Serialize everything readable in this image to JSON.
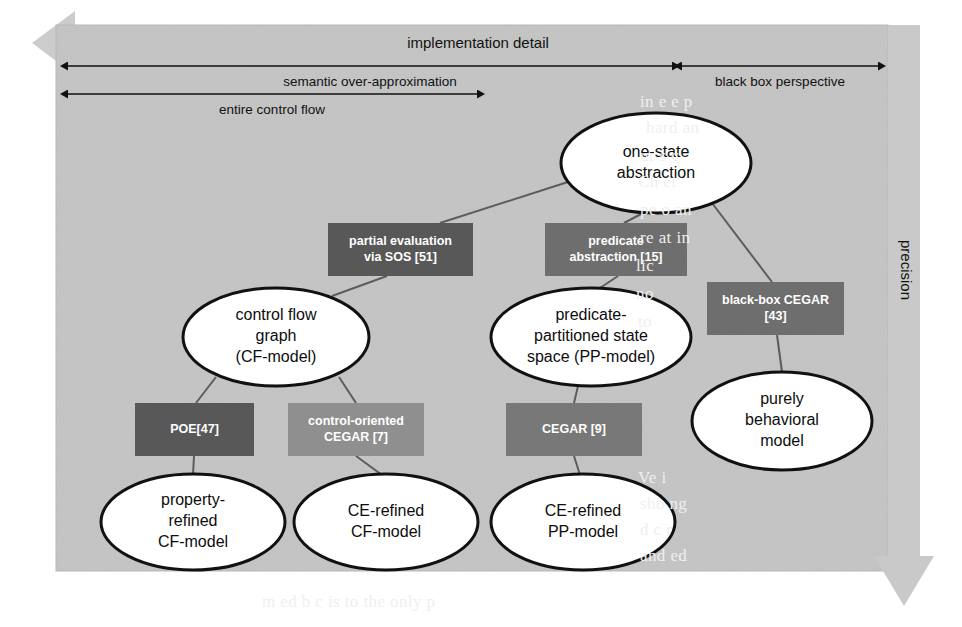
{
  "figure": {
    "panel_color": "#bfbfbf",
    "panel_color_light": "#cfcfcf",
    "arrow_gray": "#c9c9c9",
    "line_color": "#5c5c5c",
    "ellipse_fill": "#ffffff",
    "ellipse_stroke": "#111111"
  },
  "axes": {
    "vertical": {
      "label": "precision",
      "direction": "down"
    },
    "horizontal": [
      {
        "id": "implementation-detail",
        "label": "implementation detail",
        "direction": "left",
        "style": "block-arrow"
      },
      {
        "id": "semantic-over-approximation",
        "label": "semantic over-approximation",
        "direction": "both"
      },
      {
        "id": "black-box-perspective",
        "label": "black box perspective",
        "direction": "both"
      },
      {
        "id": "entire-control-flow",
        "label": "entire control flow",
        "direction": "both"
      }
    ]
  },
  "nodes": {
    "ellipses": [
      {
        "id": "one-state-abstraction",
        "lines": [
          "one-state",
          "abstraction"
        ],
        "cx": 656,
        "cy": 163,
        "rx": 95,
        "ry": 50
      },
      {
        "id": "control-flow-graph",
        "lines": [
          "control flow",
          "graph",
          "(CF-model)"
        ],
        "cx": 276,
        "cy": 337,
        "rx": 93,
        "ry": 49
      },
      {
        "id": "predicate-partitioned-state-space",
        "lines": [
          "predicate-",
          "partitioned state",
          "space (PP-model)"
        ],
        "cx": 591,
        "cy": 337,
        "rx": 100,
        "ry": 49
      },
      {
        "id": "purely-behavioral-model",
        "lines": [
          "purely",
          "behavioral",
          "model"
        ],
        "cx": 782,
        "cy": 421,
        "rx": 90,
        "ry": 49
      },
      {
        "id": "property-refined-cf-model",
        "lines": [
          "property-",
          "refined",
          "CF-model"
        ],
        "cx": 193,
        "cy": 522,
        "rx": 92,
        "ry": 48
      },
      {
        "id": "ce-refined-cf-model",
        "lines": [
          "CE-refined",
          "CF-model"
        ],
        "cx": 386,
        "cy": 522,
        "rx": 92,
        "ry": 48
      },
      {
        "id": "ce-refined-pp-model",
        "lines": [
          "CE-refined",
          "PP-model"
        ],
        "cx": 583,
        "cy": 522,
        "rx": 92,
        "ry": 48
      }
    ],
    "boxes": [
      {
        "id": "partial-evaluation-via-sos",
        "lines": [
          "partial evaluation",
          "via SOS [51]"
        ],
        "x": 328,
        "y": 223,
        "w": 145,
        "h": 53,
        "fill": "#585858"
      },
      {
        "id": "predicate-abstraction",
        "lines": [
          "predicate",
          "abstraction [15]"
        ],
        "x": 545,
        "y": 223,
        "w": 142,
        "h": 53,
        "fill": "#6e6e6e"
      },
      {
        "id": "black-box-cegar",
        "lines": [
          "black-box CEGAR",
          "[43]"
        ],
        "x": 707,
        "y": 282,
        "w": 137,
        "h": 53,
        "fill": "#6e6e6e"
      },
      {
        "id": "poe",
        "lines": [
          "POE[47]"
        ],
        "x": 135,
        "y": 403,
        "w": 119,
        "h": 53,
        "fill": "#585858"
      },
      {
        "id": "control-oriented-cegar",
        "lines": [
          "control-oriented",
          "CEGAR [7]"
        ],
        "x": 288,
        "y": 403,
        "w": 136,
        "h": 53,
        "fill": "#8f8f8f"
      },
      {
        "id": "cegar",
        "lines": [
          "CEGAR [9]"
        ],
        "x": 506,
        "y": 403,
        "w": 136,
        "h": 53,
        "fill": "#787878"
      }
    ],
    "edges": [
      {
        "id": "edge-onestate-to-partialeval",
        "from": "one-state-abstraction",
        "to": "partial-evaluation-via-sos",
        "x1": 571,
        "y1": 181,
        "x2": 440,
        "y2": 223
      },
      {
        "id": "edge-onestate-to-predabs",
        "from": "one-state-abstraction",
        "to": "predicate-abstraction",
        "x1": 643,
        "y1": 213,
        "x2": 624,
        "y2": 223
      },
      {
        "id": "edge-onestate-to-blackboxcegar",
        "from": "one-state-abstraction",
        "to": "black-box-cegar",
        "x1": 712,
        "y1": 203,
        "x2": 772,
        "y2": 282
      },
      {
        "id": "edge-partialeval-to-cfg",
        "from": "partial-evaluation-via-sos",
        "to": "control-flow-graph",
        "x1": 387,
        "y1": 276,
        "x2": 332,
        "y2": 296
      },
      {
        "id": "edge-predabs-to-pp",
        "from": "predicate-abstraction",
        "to": "predicate-partitioned-state-space",
        "x1": 618,
        "y1": 276,
        "x2": 600,
        "y2": 288
      },
      {
        "id": "edge-blackboxcegar-to-purely",
        "from": "black-box-cegar",
        "to": "purely-behavioral-model",
        "x1": 777,
        "y1": 335,
        "x2": 782,
        "y2": 372
      },
      {
        "id": "edge-cfg-to-poe",
        "from": "control-flow-graph",
        "to": "poe",
        "x1": 216,
        "y1": 377,
        "x2": 196,
        "y2": 403
      },
      {
        "id": "edge-cfg-to-coCegar",
        "from": "control-flow-graph",
        "to": "control-oriented-cegar",
        "x1": 339,
        "y1": 377,
        "x2": 356,
        "y2": 403
      },
      {
        "id": "edge-pp-to-cegar",
        "from": "predicate-partitioned-state-space",
        "to": "cegar",
        "x1": 578,
        "y1": 386,
        "x2": 574,
        "y2": 403
      },
      {
        "id": "edge-poe-to-propertyrefined",
        "from": "poe",
        "to": "property-refined-cf-model",
        "x1": 194,
        "y1": 456,
        "x2": 193,
        "y2": 475
      },
      {
        "id": "edge-coCegar-to-cerefinedcf",
        "from": "control-oriented-cegar",
        "to": "ce-refined-cf-model",
        "x1": 356,
        "y1": 456,
        "x2": 382,
        "y2": 475
      },
      {
        "id": "edge-cegar-to-cerefinedpp",
        "from": "cegar",
        "to": "ce-refined-pp-model",
        "x1": 574,
        "y1": 456,
        "x2": 580,
        "y2": 475
      }
    ]
  },
  "background_bleed": [
    {
      "text": "in   e   e    p",
      "x": 640,
      "y": 92
    },
    {
      "text": "hard     an",
      "x": 646,
      "y": 118
    },
    {
      "text": "ur    s     c",
      "x": 640,
      "y": 146
    },
    {
      "text": "Ch       ei",
      "x": 638,
      "y": 172
    },
    {
      "text": "pe   o    an",
      "x": 640,
      "y": 200
    },
    {
      "text": "re   at    in",
      "x": 640,
      "y": 228
    },
    {
      "text": "lic",
      "x": 636,
      "y": 256
    },
    {
      "text": "no",
      "x": 636,
      "y": 284
    },
    {
      "text": "to",
      "x": 638,
      "y": 312
    },
    {
      "text": "Ve   i",
      "x": 638,
      "y": 468
    },
    {
      "text": "sho   ng",
      "x": 640,
      "y": 494
    },
    {
      "text": "d   c   r",
      "x": 640,
      "y": 520
    },
    {
      "text": "and     ed",
      "x": 640,
      "y": 546
    },
    {
      "text": "m   ed  b  c    is   to  the  only  p",
      "x": 262,
      "y": 592
    }
  ]
}
